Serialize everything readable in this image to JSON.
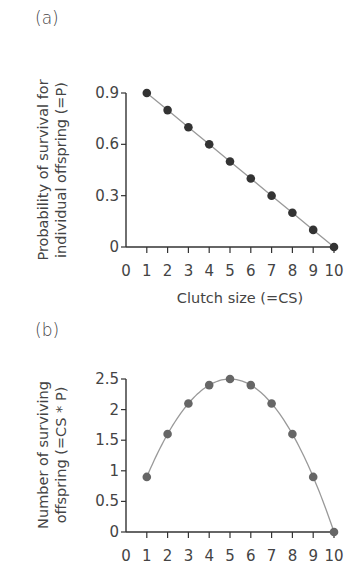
{
  "figure": {
    "panel_a_label": "(a)",
    "panel_b_label": "(b)"
  },
  "chart_data": [
    {
      "type": "line",
      "panel": "(a)",
      "title": "",
      "xlabel": "Clutch size (=CS)",
      "ylabel_line1": "Probability of survival for",
      "ylabel_line2": "individual offspring (=P)",
      "x": [
        1,
        2,
        3,
        4,
        5,
        6,
        7,
        8,
        9,
        10
      ],
      "values": [
        0.9,
        0.8,
        0.7,
        0.6,
        0.5,
        0.4,
        0.3,
        0.2,
        0.1,
        0.0
      ],
      "xlim": [
        0,
        10
      ],
      "ylim": [
        0,
        0.9
      ],
      "xticks": [
        "0",
        "1",
        "2",
        "3",
        "4",
        "5",
        "6",
        "7",
        "8",
        "9",
        "10"
      ],
      "yticks": [
        "0",
        "0.3",
        "0.6",
        "0.9"
      ],
      "marker_color": "#333333",
      "line_color": "#999999",
      "grid": false
    },
    {
      "type": "line",
      "panel": "(b)",
      "title": "",
      "xlabel": "",
      "ylabel_line1": "Number of surviving",
      "ylabel_line2": "offspring (=CS * P)",
      "x": [
        1,
        2,
        3,
        4,
        5,
        6,
        7,
        8,
        9,
        10
      ],
      "values": [
        0.9,
        1.6,
        2.1,
        2.4,
        2.5,
        2.4,
        2.1,
        1.6,
        0.9,
        0.0
      ],
      "xlim": [
        0,
        10
      ],
      "ylim": [
        0,
        2.5
      ],
      "xticks": [
        "0",
        "1",
        "2",
        "3",
        "4",
        "5",
        "6",
        "7",
        "8",
        "9",
        "10"
      ],
      "yticks": [
        "0",
        "0.5",
        "1",
        "1.5",
        "2",
        "2.5"
      ],
      "marker_color": "#666666",
      "line_color": "#999999",
      "grid": false
    }
  ]
}
